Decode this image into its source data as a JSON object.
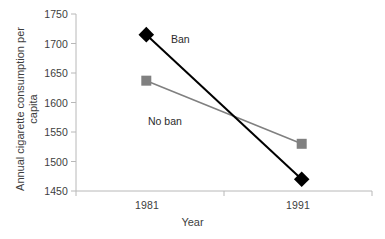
{
  "chart_data": {
    "type": "line",
    "title": "",
    "subtitle": "",
    "xlabel": "Year",
    "ylabel": "Annual cigarette consumption per capita",
    "x": [
      1981,
      1991
    ],
    "categories": [
      "1981",
      "1991"
    ],
    "xtick_labels": [
      "1981",
      "1991"
    ],
    "ytick_labels": [
      "1450",
      "1500",
      "1550",
      "1600",
      "1650",
      "1700",
      "1750"
    ],
    "ytick_values": [
      1450,
      1500,
      1550,
      1600,
      1650,
      1700,
      1750
    ],
    "ylim": [
      1450,
      1750
    ],
    "xlim": [
      1981,
      1991
    ],
    "grid": false,
    "legend_position": "inline-annotations",
    "series": [
      {
        "name": "Ban",
        "label": "Ban",
        "color": "#000000",
        "marker": "diamond",
        "values": [
          1715,
          1470
        ]
      },
      {
        "name": "No ban",
        "label": "No ban",
        "color": "#808080",
        "marker": "square",
        "values": [
          1637,
          1530
        ]
      }
    ],
    "annotations": [
      {
        "text": "Ban",
        "series": "Ban"
      },
      {
        "text": "No ban",
        "series": "No ban"
      }
    ]
  },
  "colors": {
    "ban_line": "#000000",
    "noban_line": "#808080",
    "axis": "#b3b3b3",
    "text": "#3d3d3d",
    "background": "#ffffff"
  }
}
